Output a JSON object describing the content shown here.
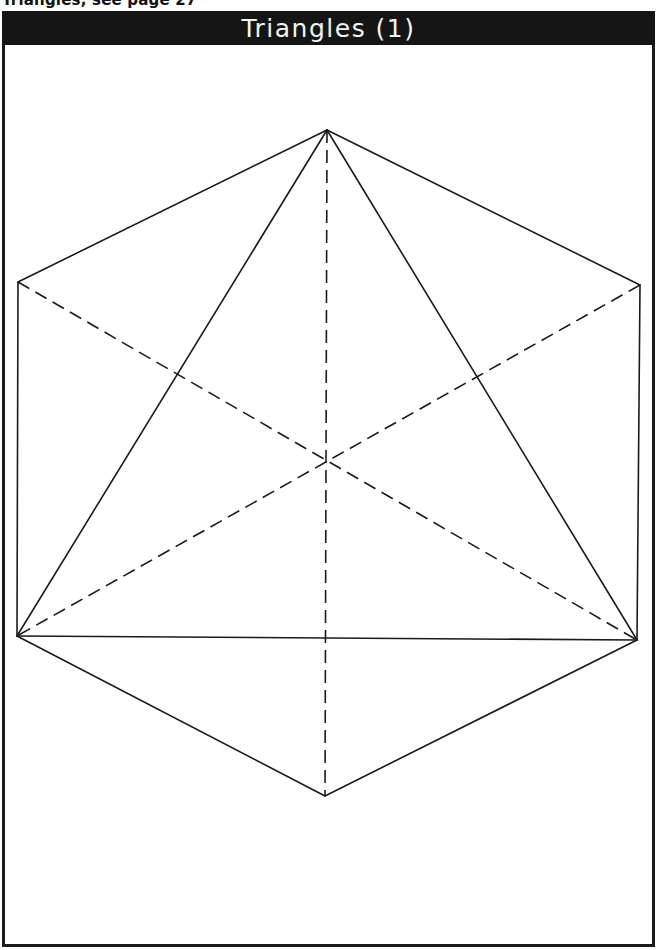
{
  "caption": "Triangles, see page 27",
  "header": {
    "title": "Triangles (1)",
    "background": "#151515",
    "text_color": "#f2f2f2"
  },
  "diagram": {
    "line_color": "#1a1a1a",
    "vertices": {
      "top": [
        327,
        130
      ],
      "upper_left": [
        18,
        282
      ],
      "upper_right": [
        640,
        285
      ],
      "lower_left": [
        17,
        636
      ],
      "lower_right": [
        637,
        640
      ],
      "bottom": [
        325,
        796
      ],
      "center": [
        326,
        460
      ]
    },
    "solid_edges": [
      [
        "top",
        "upper_left"
      ],
      [
        "top",
        "upper_right"
      ],
      [
        "upper_left",
        "lower_left"
      ],
      [
        "upper_right",
        "lower_right"
      ],
      [
        "lower_left",
        "bottom"
      ],
      [
        "lower_right",
        "bottom"
      ],
      [
        "top",
        "lower_left"
      ],
      [
        "top",
        "lower_right"
      ],
      [
        "lower_left",
        "lower_right"
      ]
    ],
    "dashed_edges": [
      [
        "top",
        "bottom"
      ],
      [
        "upper_left",
        "lower_right"
      ],
      [
        "upper_right",
        "lower_left"
      ]
    ]
  }
}
